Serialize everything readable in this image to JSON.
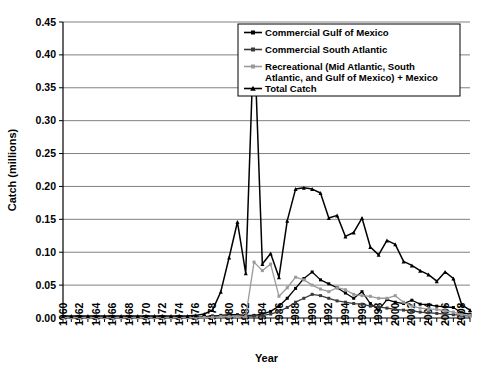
{
  "chart_data": {
    "type": "line",
    "title": "",
    "xlabel": "Year",
    "ylabel": "Catch (millions)",
    "xlim": [
      1960,
      2009
    ],
    "ylim": [
      0.0,
      0.45
    ],
    "ytick_step": 0.05,
    "grid": "horizontal",
    "legend_position": "top-right",
    "ytick_labels": [
      "0.00",
      "0.05",
      "0.10",
      "0.15",
      "0.20",
      "0.25",
      "0.30",
      "0.35",
      "0.40",
      "0.45"
    ],
    "ytick_values": [
      0.0,
      0.05,
      0.1,
      0.15,
      0.2,
      0.25,
      0.3,
      0.35,
      0.4,
      0.45
    ],
    "xtick_labels": [
      "1960",
      "1962",
      "1964",
      "1966",
      "1968",
      "1970",
      "1972",
      "1974",
      "1976",
      "1978",
      "1980",
      "1982",
      "1984",
      "1986",
      "1988",
      "1990",
      "1992",
      "1994",
      "1996",
      "1998",
      "2000",
      "2002",
      "2004",
      "2006",
      "2008"
    ],
    "xtick_values": [
      1960,
      1962,
      1964,
      1966,
      1968,
      1970,
      1972,
      1974,
      1976,
      1978,
      1980,
      1982,
      1984,
      1986,
      1988,
      1990,
      1992,
      1994,
      1996,
      1998,
      2000,
      2002,
      2004,
      2006,
      2008
    ],
    "x": [
      1960,
      1961,
      1962,
      1963,
      1964,
      1965,
      1966,
      1967,
      1968,
      1969,
      1970,
      1971,
      1972,
      1973,
      1974,
      1975,
      1976,
      1977,
      1978,
      1979,
      1980,
      1981,
      1982,
      1983,
      1984,
      1985,
      1986,
      1987,
      1988,
      1989,
      1990,
      1991,
      1992,
      1993,
      1994,
      1995,
      1996,
      1997,
      1998,
      1999,
      2000,
      2001,
      2002,
      2003,
      2004,
      2005,
      2006,
      2007,
      2008,
      2009
    ],
    "series": [
      {
        "name": "Commercial Gulf of Mexico",
        "color": "#000000",
        "marker": "square",
        "values": [
          0.001,
          0.001,
          0.001,
          0.001,
          0.001,
          0.001,
          0.001,
          0.001,
          0.001,
          0.001,
          0.001,
          0.001,
          0.001,
          0.001,
          0.001,
          0.001,
          0.001,
          0.002,
          0.003,
          0.004,
          0.005,
          0.005,
          0.004,
          0.004,
          0.006,
          0.01,
          0.018,
          0.03,
          0.045,
          0.06,
          0.07,
          0.058,
          0.052,
          0.046,
          0.038,
          0.03,
          0.04,
          0.022,
          0.012,
          0.028,
          0.024,
          0.022,
          0.027,
          0.021,
          0.02,
          0.018,
          0.017,
          0.016,
          0.008,
          0.006
        ]
      },
      {
        "name": "Commercial South Atlantic",
        "color": "#3a3a3a",
        "marker": "square",
        "values": [
          0.0005,
          0.0005,
          0.0005,
          0.0005,
          0.0005,
          0.0005,
          0.0005,
          0.0005,
          0.0005,
          0.0005,
          0.0005,
          0.0005,
          0.0005,
          0.0005,
          0.0005,
          0.0005,
          0.0005,
          0.001,
          0.002,
          0.003,
          0.003,
          0.003,
          0.003,
          0.003,
          0.004,
          0.006,
          0.01,
          0.016,
          0.024,
          0.03,
          0.036,
          0.034,
          0.03,
          0.026,
          0.024,
          0.022,
          0.021,
          0.018,
          0.017,
          0.015,
          0.013,
          0.012,
          0.011,
          0.009,
          0.008,
          0.007,
          0.006,
          0.005,
          0.004,
          0.003
        ]
      },
      {
        "name": "Recreational (Mid Atlantic, South Atlantic, and Gulf of Mexico) + Mexico",
        "color": "#9a9a9a",
        "marker": "square",
        "values": [
          0.0005,
          0.0005,
          0.0005,
          0.0005,
          0.0005,
          0.0005,
          0.0005,
          0.0005,
          0.0005,
          0.0005,
          0.0005,
          0.0005,
          0.0005,
          0.0005,
          0.0005,
          0.0005,
          0.0005,
          0.001,
          0.001,
          0.002,
          0.002,
          0.002,
          0.002,
          0.085,
          0.072,
          0.082,
          0.033,
          0.046,
          0.062,
          0.058,
          0.05,
          0.044,
          0.04,
          0.046,
          0.043,
          0.036,
          0.034,
          0.033,
          0.03,
          0.03,
          0.034,
          0.024,
          0.018,
          0.015,
          0.014,
          0.013,
          0.011,
          0.009,
          0.005,
          0.004
        ]
      },
      {
        "name": "Total Catch",
        "color": "#000000",
        "marker": "triangle",
        "values": [
          0.003,
          0.003,
          0.003,
          0.003,
          0.003,
          0.003,
          0.003,
          0.003,
          0.003,
          0.003,
          0.003,
          0.003,
          0.003,
          0.003,
          0.003,
          0.003,
          0.004,
          0.006,
          0.012,
          0.04,
          0.092,
          0.146,
          0.068,
          0.435,
          0.082,
          0.098,
          0.062,
          0.148,
          0.196,
          0.198,
          0.196,
          0.19,
          0.152,
          0.156,
          0.124,
          0.13,
          0.152,
          0.108,
          0.096,
          0.118,
          0.112,
          0.086,
          0.08,
          0.072,
          0.066,
          0.056,
          0.07,
          0.06,
          0.02,
          0.012
        ]
      }
    ],
    "legend_entries": [
      "Commercial Gulf of Mexico",
      "Commercial South Atlantic",
      "Recreational (Mid Atlantic, South",
      "Atlantic, and Gulf of Mexico) + Mexico",
      "Total Catch"
    ]
  }
}
